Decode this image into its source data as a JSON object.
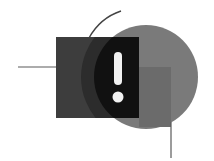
{
  "illustration": {
    "subject": "warning-alert-icon",
    "symbol": "!",
    "colors": {
      "background": "#ffffff",
      "rectangle": "#3d3d3d",
      "outer_arc_band": "#2c2c2c",
      "intersection": "#111111",
      "circle": "#7a7a7a",
      "inner_square": "#6b6b6b",
      "lines": "#5a5a5a",
      "exclamation": "#f2f2f2"
    }
  }
}
